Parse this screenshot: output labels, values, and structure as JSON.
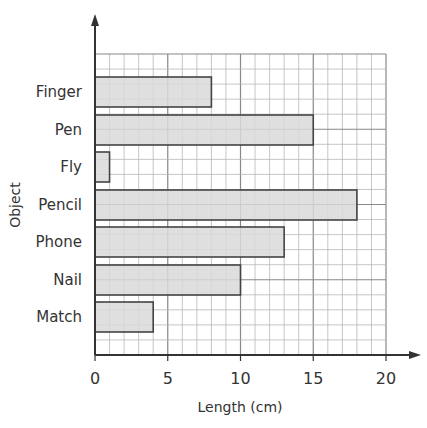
{
  "chart_data": {
    "type": "bar",
    "orientation": "horizontal",
    "title": "",
    "xlabel": "Length (cm)",
    "ylabel": "Object",
    "categories": [
      "Finger",
      "Pen",
      "Fly",
      "Pencil",
      "Phone",
      "Nail",
      "Match"
    ],
    "values": [
      8,
      15,
      1,
      18,
      13,
      10,
      4
    ],
    "xlim": [
      0,
      20
    ],
    "xticks": [
      0,
      5,
      10,
      15,
      20
    ],
    "grid": true,
    "legend": null,
    "colors": {
      "bar_fill": "#d9d9d9",
      "bar_stroke": "#444444",
      "grid_minor": "#b8b8b8",
      "grid_major": "#888888",
      "axis": "#333333"
    }
  }
}
